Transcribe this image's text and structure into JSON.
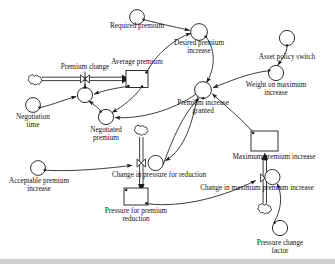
{
  "diagram": {
    "type": "system-dynamics-stock-and-flow",
    "title": "",
    "colors": {
      "stroke": "#1a1a1a",
      "fill": "#ffffff",
      "text": "#111111",
      "footer_bar": "#cfcfcf"
    },
    "nodes": [
      {
        "id": "required_premium",
        "label": "Required premium",
        "kind": "auxiliary",
        "x": 137,
        "y": 17,
        "r": 7.5,
        "label_x": 137,
        "label_y": 27
      },
      {
        "id": "desired_premium_increase",
        "label": "Desired premium\nincrease",
        "kind": "auxiliary",
        "x": 199,
        "y": 32,
        "r": 8.5,
        "label_x": 199,
        "label_y": 43
      },
      {
        "id": "asset_policy_switch",
        "label": "Asset policy switch",
        "kind": "auxiliary",
        "x": 287,
        "y": 38,
        "r": 7.5,
        "label_x": 287,
        "label_y": 54
      },
      {
        "id": "weight_on_maximum_increase",
        "label": "Weight on maximum\nincrease",
        "kind": "auxiliary",
        "x": 276,
        "y": 73,
        "r": 7.5,
        "label_x": 276,
        "label_y": 84
      },
      {
        "id": "average_premium",
        "label": "Average premium",
        "kind": "stock",
        "x": 137,
        "y": 79,
        "w": 22,
        "h": 17,
        "label_x": 137,
        "label_y": 62
      },
      {
        "id": "premium_change",
        "label": "Premium change",
        "kind": "flow-valve",
        "x": 85,
        "y": 79,
        "r": 0,
        "label_x": 85,
        "label_y": 67
      },
      {
        "id": "premium_change_cloud",
        "label": "",
        "kind": "cloud",
        "x": 35,
        "y": 79,
        "r": 5
      },
      {
        "id": "negotiation_aux",
        "label": "",
        "kind": "auxiliary",
        "x": 85,
        "y": 95,
        "r": 7.5
      },
      {
        "id": "negotiation_time",
        "label": "Negotiation\ntime",
        "kind": "auxiliary",
        "x": 33,
        "y": 105,
        "r": 7.5,
        "label_x": 33,
        "label_y": 116
      },
      {
        "id": "negotiated_premium",
        "label": "Negotiated\npremium",
        "kind": "auxiliary",
        "x": 106,
        "y": 117,
        "r": 7.5,
        "label_x": 106,
        "label_y": 128
      },
      {
        "id": "premium_increase_granted",
        "label": "Premium increase\ngranted",
        "kind": "auxiliary",
        "x": 203,
        "y": 90,
        "r": 8.5,
        "label_x": 203,
        "label_y": 101
      },
      {
        "id": "maximum_premium_increase",
        "label": "Maximum premium increase",
        "kind": "stock",
        "x": 265,
        "y": 141,
        "w": 26,
        "h": 20,
        "label_x": 265,
        "label_y": 157
      },
      {
        "id": "change_in_max_premium_inc",
        "label": "Change in maximum premium increase",
        "kind": "flow-valve",
        "x": 265,
        "y": 178,
        "r": 7.5,
        "label_x": 265,
        "label_y": 188
      },
      {
        "id": "change_max_cloud",
        "label": "",
        "kind": "cloud",
        "x": 265,
        "y": 208,
        "r": 5
      },
      {
        "id": "pressure_change_factor",
        "label": "Pressure change\nfactor",
        "kind": "auxiliary",
        "x": 280,
        "y": 228,
        "r": 7.5,
        "label_x": 280,
        "label_y": 241
      },
      {
        "id": "change_in_pressure_for_red",
        "label": "Change in pressure for reduction",
        "kind": "flow-valve",
        "x": 155,
        "y": 163,
        "r": 7.5,
        "label_x": 155,
        "label_y": 174
      },
      {
        "id": "change_pressure_cloud",
        "label": "",
        "kind": "cloud",
        "x": 141,
        "y": 129,
        "r": 5
      },
      {
        "id": "acceptable_premium_increase",
        "label": "Acceptable premium\nincrease",
        "kind": "auxiliary",
        "x": 38,
        "y": 168,
        "r": 7.5,
        "label_x": 38,
        "label_y": 181
      },
      {
        "id": "pressure_for_premium_red",
        "label": "Pressure for premium\nreduction",
        "kind": "stock",
        "x": 136,
        "y": 196,
        "w": 24,
        "h": 17,
        "label_x": 136,
        "label_y": 209
      }
    ],
    "links": [
      {
        "from": "required_premium",
        "to": "desired_premium_increase",
        "kind": "info"
      },
      {
        "from": "average_premium",
        "to": "desired_premium_increase",
        "kind": "info"
      },
      {
        "from": "desired_premium_increase",
        "to": "premium_increase_granted",
        "kind": "info"
      },
      {
        "from": "asset_policy_switch",
        "to": "weight_on_maximum_increase",
        "kind": "info"
      },
      {
        "from": "weight_on_maximum_increase",
        "to": "premium_increase_granted",
        "kind": "info"
      },
      {
        "from": "maximum_premium_increase",
        "to": "premium_increase_granted",
        "kind": "info"
      },
      {
        "from": "pressure_for_premium_red",
        "to": "premium_increase_granted",
        "kind": "info"
      },
      {
        "from": "premium_increase_granted",
        "to": "negotiated_premium",
        "kind": "info"
      },
      {
        "from": "premium_increase_granted",
        "to": "change_in_pressure_for_red",
        "kind": "info"
      },
      {
        "from": "average_premium",
        "to": "negotiated_premium",
        "kind": "info"
      },
      {
        "from": "average_premium",
        "to": "negotiation_aux",
        "kind": "info"
      },
      {
        "from": "negotiated_premium",
        "to": "negotiation_aux",
        "kind": "info"
      },
      {
        "from": "negotiation_time",
        "to": "negotiation_aux",
        "kind": "info"
      },
      {
        "from": "negotiation_aux",
        "to": "premium_change",
        "kind": "info"
      },
      {
        "from": "premium_change_cloud",
        "to": "average_premium",
        "kind": "flow"
      },
      {
        "from": "change_pressure_cloud",
        "to": "pressure_for_premium_red",
        "kind": "flow"
      },
      {
        "from": "acceptable_premium_increase",
        "to": "change_in_pressure_for_red",
        "kind": "info"
      },
      {
        "from": "change_max_cloud",
        "to": "maximum_premium_increase",
        "kind": "flow"
      },
      {
        "from": "pressure_change_factor",
        "to": "change_in_max_premium_inc",
        "kind": "info"
      },
      {
        "from": "pressure_for_premium_red",
        "to": "change_in_max_premium_inc",
        "kind": "info"
      }
    ],
    "labels": {
      "required_premium": "Required premium",
      "desired_premium_increase_l1": "Desired premium",
      "desired_premium_increase_l2": "increase",
      "asset_policy_switch": "Asset policy switch",
      "weight_on_maximum_increase_l1": "Weight on maximum",
      "weight_on_maximum_increase_l2": "increase",
      "average_premium": "Average premium",
      "premium_change": "Premium change",
      "negotiation_time_l1": "Negotiation",
      "negotiation_time_l2": "time",
      "negotiated_premium_l1": "Negotiated",
      "negotiated_premium_l2": "premium",
      "premium_increase_granted_l1": "Premium increase",
      "premium_increase_granted_l2": "granted",
      "maximum_premium_increase": "Maximum premium increase",
      "change_in_max_premium_increase": "Change in maximum premium increase",
      "pressure_change_factor_l1": "Pressure change",
      "pressure_change_factor_l2": "factor",
      "change_in_pressure_for_reduction": "Change in pressure for reduction",
      "acceptable_premium_increase_l1": "Acceptable premium",
      "acceptable_premium_increase_l2": "increase",
      "pressure_for_premium_reduction_l1": "Pressure for premium",
      "pressure_for_premium_reduction_l2": "reduction"
    }
  }
}
